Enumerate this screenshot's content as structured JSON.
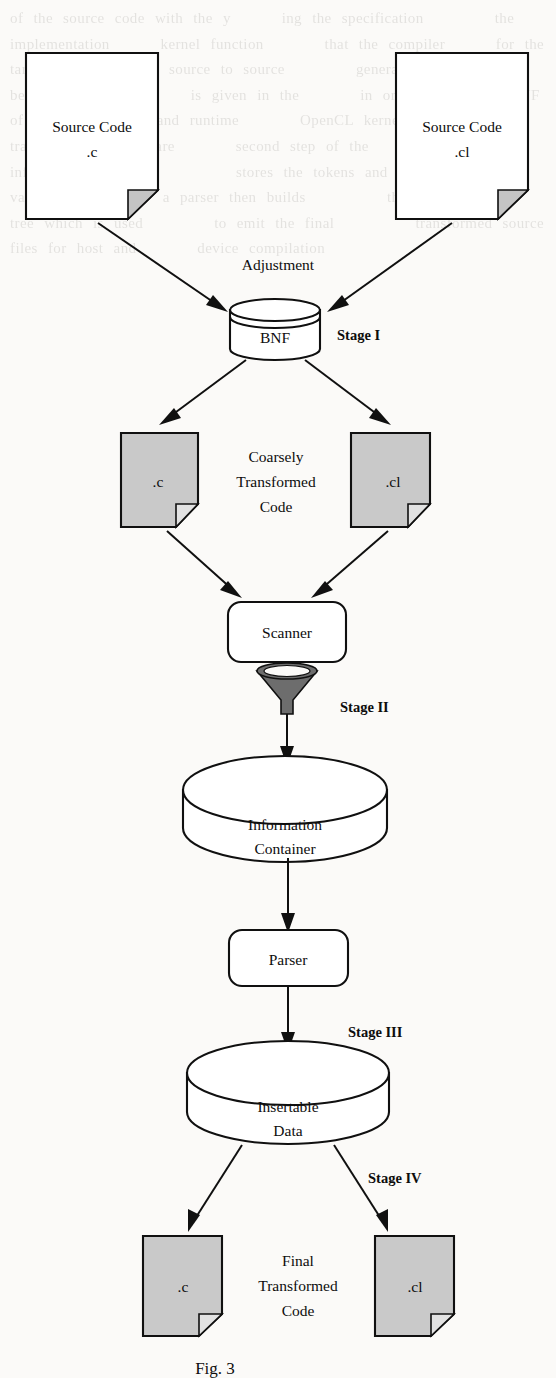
{
  "figure": {
    "caption": "Fig. 3"
  },
  "nodes": {
    "source_c": {
      "line1": "Source Code",
      "line2": ".c"
    },
    "source_cl": {
      "line1": "Source Code",
      "line2": ".cl"
    },
    "adjustment": {
      "label": "Adjustment"
    },
    "bnf": {
      "label": "BNF"
    },
    "coarse_c": {
      "label": ".c"
    },
    "coarse_cl": {
      "label": ".cl"
    },
    "coarse_caption": {
      "line1": "Coarsely",
      "line2": "Transformed",
      "line3": "Code"
    },
    "scanner": {
      "label": "Scanner"
    },
    "info_container": {
      "line1": "Information",
      "line2": "Container"
    },
    "parser": {
      "label": "Parser"
    },
    "insertable": {
      "line1": "Insertable",
      "line2": "Data"
    },
    "final_c": {
      "label": ".c"
    },
    "final_cl": {
      "label": ".cl"
    },
    "final_caption": {
      "line1": "Final",
      "line2": "Transformed",
      "line3": "Code"
    }
  },
  "stages": {
    "one": "Stage  I",
    "two": "Stage  II",
    "three": "Stage  III",
    "four": "Stage  IV"
  },
  "colors": {
    "ink": "#101010",
    "gray_fill": "#c9c9c9",
    "paper": "#fbfaf8",
    "funnel": "#6d6d6d"
  },
  "ghost_text": "of the source code with the y     ing the specification       the implementation     kernel function      that the compiler     for the target device       source to source       generate the code       be used to build      is given in the      in order to    the BNF of the     library and runtime      OpenCL kernels are      transformation rules are      second step of the        the information container        stores the tokens and         symbol values from       a parser then builds        the abstract syntax        tree which is used       to emit the final        transformed source       files for host and      device compilation"
}
